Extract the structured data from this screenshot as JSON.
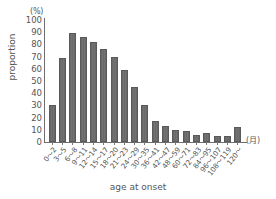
{
  "chart_data": {
    "type": "bar",
    "title": "",
    "subtitle": "",
    "xlabel": "age at onset",
    "ylabel": "proportion",
    "y_unit": "(%)",
    "x_unit": "(月)",
    "ylim": [
      0,
      100
    ],
    "yticks": [
      100,
      90,
      80,
      70,
      60,
      50,
      40,
      30,
      20,
      10,
      0
    ],
    "grid": false,
    "legend": null,
    "bar_color": "#6f6f6f",
    "axis_color": "#6e6e6e",
    "text_color": "#555555",
    "categories": [
      "0～2",
      "3～5",
      "6～8",
      "9～11",
      "12～14",
      "15～17",
      "18～20",
      "21～23",
      "24～29",
      "30～35",
      "36～41",
      "42～47",
      "48～59",
      "60～71",
      "72～83",
      "84～95",
      "96～107",
      "108～119",
      "120～"
    ],
    "values": [
      30,
      69,
      89,
      86,
      82,
      76,
      70,
      59,
      45,
      30,
      17,
      13,
      10,
      9,
      6,
      7,
      5,
      5,
      12
    ]
  }
}
